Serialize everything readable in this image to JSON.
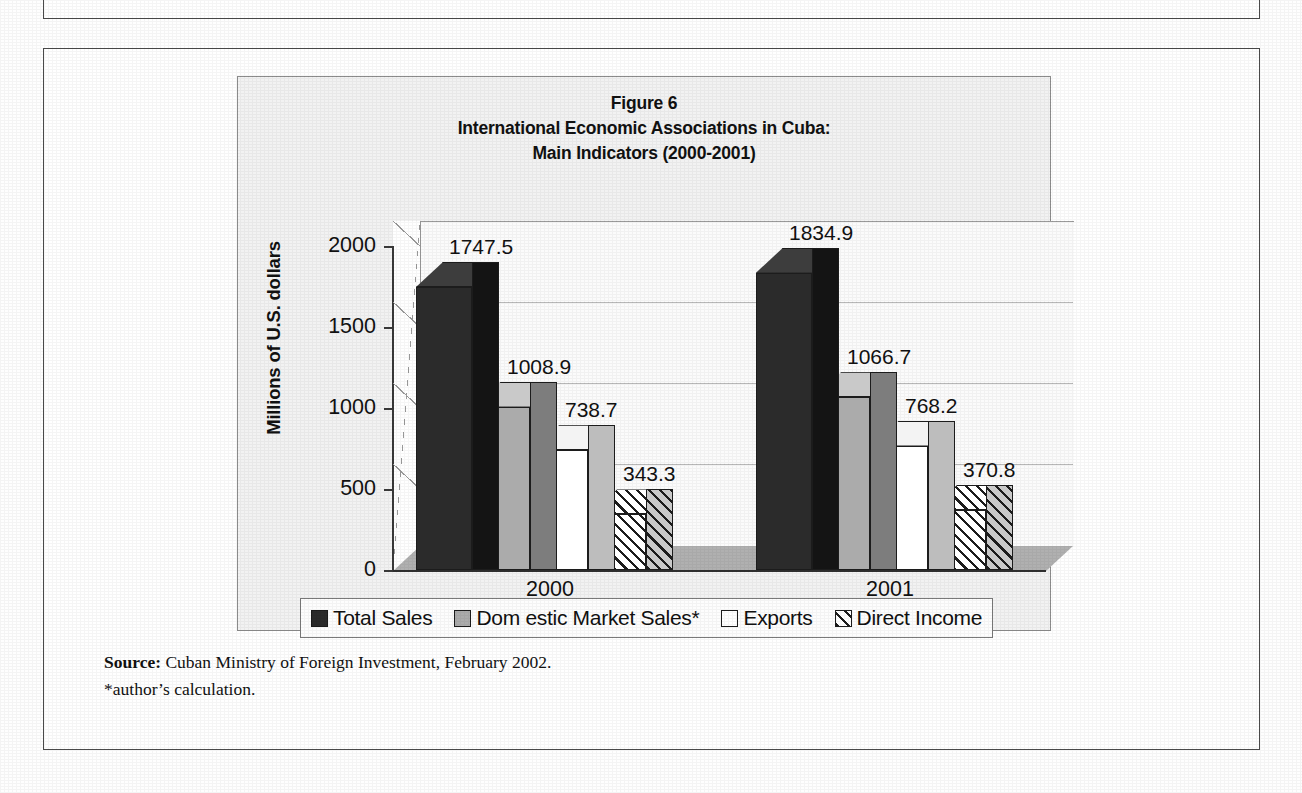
{
  "figure": {
    "title_line1": "Figure 6",
    "title_line2": "International Economic Associations in Cuba:",
    "title_line3": "Main Indicators (2000-2001)"
  },
  "source": {
    "label": "Source:",
    "text": " Cuban Ministry of Foreign Investment, February 2002.",
    "footnote": "*author’s calculation."
  },
  "chart_data": {
    "type": "bar",
    "xlabel": "",
    "ylabel": "Millions of U.S. dollars",
    "categories": [
      "2000",
      "2001"
    ],
    "ylim": [
      0,
      2000
    ],
    "yticks": [
      "0",
      "500",
      "1000",
      "1500",
      "2000"
    ],
    "grid": true,
    "legend_position": "bottom",
    "three_d": true,
    "series": [
      {
        "name": "Total Sales",
        "swatch": "#2b2b2b",
        "pattern": "solid-dark",
        "values": [
          1747.5,
          1834.9
        ],
        "labels": [
          "1747.5",
          "1834.9"
        ]
      },
      {
        "name": "Dom estic Market Sales*",
        "swatch": "#ababab",
        "pattern": "solid-gray",
        "values": [
          1008.9,
          1066.7
        ],
        "labels": [
          "1008.9",
          "1066.7"
        ]
      },
      {
        "name": "Exports",
        "swatch": "#ffffff",
        "pattern": "solid-white",
        "values": [
          738.7,
          768.2
        ],
        "labels": [
          "738.7",
          "768.2"
        ]
      },
      {
        "name": "Direct Income",
        "swatch": "#ffffff",
        "pattern": "diagonal-hatch",
        "values": [
          343.3,
          370.8
        ],
        "labels": [
          "343.3",
          "370.8"
        ]
      }
    ]
  }
}
